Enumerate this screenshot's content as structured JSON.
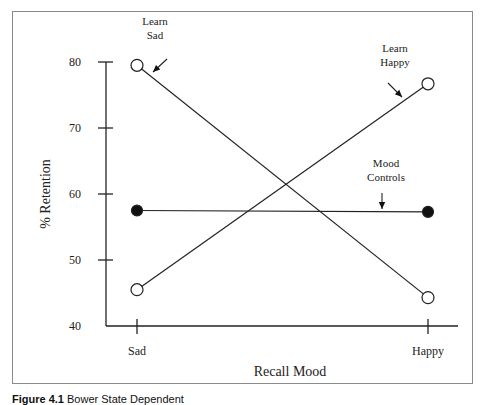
{
  "chart_data": {
    "type": "line",
    "title": "",
    "xlabel": "Recall Mood",
    "ylabel": "% Retention",
    "categories": [
      "Sad",
      "Happy"
    ],
    "yticks": [
      40,
      50,
      60,
      70,
      80
    ],
    "ylim": [
      40,
      80
    ],
    "grid": false,
    "legend": "inline annotations with arrows",
    "series": [
      {
        "name": "Learn Sad",
        "label_lines": [
          "Learn",
          "Sad"
        ],
        "marker": "open-circle",
        "values": [
          79.5,
          44.3
        ]
      },
      {
        "name": "Learn Happy",
        "label_lines": [
          "Learn",
          "Happy"
        ],
        "marker": "open-circle",
        "values": [
          45.5,
          76.7
        ]
      },
      {
        "name": "Mood Controls",
        "label_lines": [
          "Mood",
          "Controls"
        ],
        "marker": "filled-circle",
        "values": [
          57.5,
          57.3
        ]
      }
    ]
  },
  "caption": {
    "label": "Figure 4.1",
    "text": "Bower State Dependent"
  }
}
